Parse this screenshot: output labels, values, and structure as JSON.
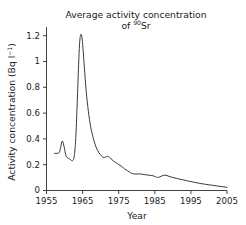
{
  "chart_data": {
    "type": "line",
    "title_line1": "Average activity concentration",
    "title_line2_prefix": "of ",
    "title_line2_sup": "90",
    "title_line2_suffix": "Sr",
    "xlabel": "Year",
    "ylabel": "Activity concentration (Bq l⁻¹)",
    "ylabel_prefix": "Activity concentration (Bq l",
    "ylabel_sup": "−1",
    "ylabel_suffix": ")",
    "xlim": [
      1955,
      2005
    ],
    "ylim": [
      0,
      1.32
    ],
    "xticks": [
      1955,
      1965,
      1975,
      1985,
      1995,
      2005
    ],
    "xticklabels": [
      "1955",
      "1965",
      "1975",
      "1985",
      "1995",
      "2005"
    ],
    "yticks": [
      0,
      0.2,
      0.4,
      0.6,
      0.8,
      1,
      1.2
    ],
    "yticklabels": [
      "0",
      "0.2",
      "0.4",
      "0.6",
      "0.8",
      "1",
      "1.2"
    ],
    "grid": false,
    "legend": "none",
    "line_color": "#3a3a3a",
    "background_color": "#ffffff",
    "series": [
      {
        "name": "Sr-90 activity concentration",
        "x": [
          1957.2,
          1958.0,
          1958.6,
          1959.0,
          1959.4,
          1959.9,
          1960.4,
          1961.0,
          1961.6,
          1962.2,
          1962.7,
          1963.1,
          1963.5,
          1963.9,
          1964.2,
          1964.5,
          1964.8,
          1965.1,
          1965.5,
          1966.0,
          1966.6,
          1967.2,
          1967.9,
          1968.6,
          1969.4,
          1970.2,
          1970.9,
          1971.4,
          1971.9,
          1972.4,
          1972.9,
          1973.5,
          1974.2,
          1975.0,
          1975.8,
          1976.6,
          1977.4,
          1978.2,
          1979.0,
          1979.8,
          1980.6,
          1981.4,
          1982.2,
          1983.0,
          1983.8,
          1984.6,
          1985.2,
          1985.7,
          1986.2,
          1986.8,
          1987.3,
          1987.8,
          1988.4,
          1989.2,
          1990.0,
          1991.0,
          1992.0,
          1993.0,
          1994.0,
          1995.0,
          1996.0,
          1997.0,
          1998.0,
          1999.0,
          2000.0,
          2001.0,
          2002.0,
          2003.0,
          2004.0,
          2005.0
        ],
        "y": [
          0.3,
          0.3,
          0.31,
          0.36,
          0.4,
          0.35,
          0.28,
          0.26,
          0.25,
          0.24,
          0.28,
          0.42,
          0.7,
          1.02,
          1.2,
          1.26,
          1.24,
          1.15,
          0.99,
          0.8,
          0.64,
          0.52,
          0.43,
          0.36,
          0.31,
          0.28,
          0.265,
          0.27,
          0.275,
          0.27,
          0.255,
          0.24,
          0.225,
          0.21,
          0.195,
          0.175,
          0.16,
          0.145,
          0.135,
          0.133,
          0.134,
          0.132,
          0.128,
          0.125,
          0.122,
          0.118,
          0.112,
          0.105,
          0.108,
          0.115,
          0.122,
          0.124,
          0.12,
          0.112,
          0.105,
          0.098,
          0.091,
          0.085,
          0.078,
          0.072,
          0.066,
          0.06,
          0.055,
          0.05,
          0.046,
          0.042,
          0.038,
          0.034,
          0.03,
          0.025
        ]
      }
    ]
  }
}
